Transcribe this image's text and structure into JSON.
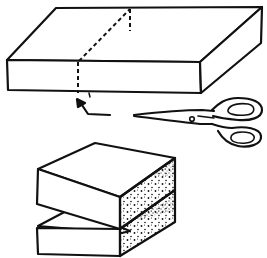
{
  "illustration": {
    "description": "Line drawing showing a box being cut with scissors along a dashed line, then the cut halves stacked",
    "labels": {
      "top_box": "uncut box with dashed cutting line",
      "arrow": "arrow pointing to cut line",
      "scissors": "scissors",
      "bottom_stack": "two cut halves stacked with stippled cut faces"
    },
    "colors": {
      "stroke": "#111111",
      "background": "#ffffff",
      "stipple": "#111111"
    }
  }
}
